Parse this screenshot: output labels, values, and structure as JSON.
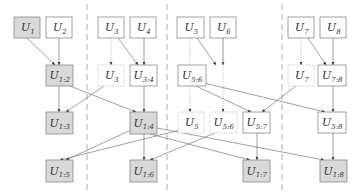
{
  "diagram": {
    "title": "",
    "colors": {
      "shaded_fill": "#d9d9d9",
      "plain_fill": "#ffffff",
      "stroke": "#8a8a8a",
      "edge": "#7a7a7a"
    },
    "separators": [
      87,
      167,
      282
    ],
    "nodes": [
      {
        "id": "r1_u1",
        "main": "U",
        "sub": "1",
        "x": 14,
        "y": 17,
        "w": 26,
        "h": 21,
        "style": "shaded"
      },
      {
        "id": "r1_u2",
        "main": "U",
        "sub": "2",
        "x": 46,
        "y": 17,
        "w": 26,
        "h": 21,
        "style": "plain"
      },
      {
        "id": "r1_u3",
        "main": "U",
        "sub": "3",
        "x": 98,
        "y": 17,
        "w": 26,
        "h": 21,
        "style": "plain"
      },
      {
        "id": "r1_u4",
        "main": "U",
        "sub": "4",
        "x": 130,
        "y": 17,
        "w": 26,
        "h": 21,
        "style": "plain"
      },
      {
        "id": "r1_u5",
        "main": "U",
        "sub": "5",
        "x": 177,
        "y": 17,
        "w": 27,
        "h": 21,
        "style": "plain"
      },
      {
        "id": "r1_u6",
        "main": "U",
        "sub": "6",
        "x": 210,
        "y": 17,
        "w": 26,
        "h": 21,
        "style": "plain"
      },
      {
        "id": "r1_u7",
        "main": "U",
        "sub": "7",
        "x": 288,
        "y": 17,
        "w": 26,
        "h": 21,
        "style": "plain"
      },
      {
        "id": "r1_u8",
        "main": "U",
        "sub": "8",
        "x": 320,
        "y": 17,
        "w": 26,
        "h": 21,
        "style": "plain"
      },
      {
        "id": "r2_u12",
        "main": "U",
        "sub": "1:2",
        "x": 46,
        "y": 65,
        "w": 27,
        "h": 21,
        "style": "shaded"
      },
      {
        "id": "r2_u3",
        "main": "U",
        "sub": "3",
        "x": 98,
        "y": 65,
        "w": 26,
        "h": 21,
        "style": "dotted"
      },
      {
        "id": "r2_u34",
        "main": "U",
        "sub": "3:4",
        "x": 130,
        "y": 65,
        "w": 27,
        "h": 21,
        "style": "plain"
      },
      {
        "id": "r2_u56",
        "main": "U",
        "sub": "5:6",
        "x": 178,
        "y": 65,
        "w": 28,
        "h": 21,
        "style": "plain"
      },
      {
        "id": "r2_u7",
        "main": "U",
        "sub": "7",
        "x": 288,
        "y": 65,
        "w": 26,
        "h": 21,
        "style": "dotted"
      },
      {
        "id": "r2_u78",
        "main": "U",
        "sub": "7:8",
        "x": 318,
        "y": 65,
        "w": 28,
        "h": 21,
        "style": "plain"
      },
      {
        "id": "r3_u13",
        "main": "U",
        "sub": "1:3",
        "x": 46,
        "y": 112,
        "w": 27,
        "h": 22,
        "style": "shaded"
      },
      {
        "id": "r3_u14",
        "main": "U",
        "sub": "1:4",
        "x": 130,
        "y": 112,
        "w": 27,
        "h": 22,
        "style": "shaded"
      },
      {
        "id": "r3_u5",
        "main": "U",
        "sub": "5",
        "x": 178,
        "y": 112,
        "w": 26,
        "h": 21,
        "style": "dotted"
      },
      {
        "id": "r3_u56",
        "main": "U",
        "sub": "5:6",
        "x": 210,
        "y": 112,
        "w": 27,
        "h": 21,
        "style": "dotted"
      },
      {
        "id": "r3_u57",
        "main": "U",
        "sub": "5:7",
        "x": 243,
        "y": 112,
        "w": 27,
        "h": 21,
        "style": "plain"
      },
      {
        "id": "r3_u58",
        "main": "U",
        "sub": "5:8",
        "x": 318,
        "y": 112,
        "w": 28,
        "h": 21,
        "style": "plain"
      },
      {
        "id": "r4_u15",
        "main": "U",
        "sub": "1:5",
        "x": 46,
        "y": 160,
        "w": 27,
        "h": 22,
        "style": "shaded"
      },
      {
        "id": "r4_u16",
        "main": "U",
        "sub": "1:6",
        "x": 130,
        "y": 160,
        "w": 27,
        "h": 22,
        "style": "shaded"
      },
      {
        "id": "r4_u17",
        "main": "U",
        "sub": "1:7",
        "x": 243,
        "y": 160,
        "w": 27,
        "h": 22,
        "style": "shaded"
      },
      {
        "id": "r4_u18",
        "main": "U",
        "sub": "1:8",
        "x": 320,
        "y": 160,
        "w": 27,
        "h": 22,
        "style": "shaded"
      }
    ],
    "edges": [
      {
        "from": "r1_u1",
        "to": "r2_u12",
        "x1": 27,
        "y1": 38,
        "x2": 55,
        "y2": 65
      },
      {
        "from": "r1_u2",
        "to": "r2_u12",
        "x1": 59,
        "y1": 38,
        "x2": 59,
        "y2": 65
      },
      {
        "from": "r1_u3",
        "to": "r2_u3",
        "x1": 111,
        "y1": 38,
        "x2": 111,
        "y2": 65,
        "style": "dotted"
      },
      {
        "from": "r1_u3",
        "to": "r2_u34",
        "x1": 118,
        "y1": 38,
        "x2": 138,
        "y2": 65
      },
      {
        "from": "r1_u4",
        "to": "r2_u34",
        "x1": 144,
        "y1": 38,
        "x2": 144,
        "y2": 65
      },
      {
        "from": "r1_u5",
        "to": "r2_u56",
        "x1": 197,
        "y1": 38,
        "x2": 216,
        "y2": 65
      },
      {
        "from": "r1_u6",
        "to": "r2_u56",
        "x1": 223,
        "y1": 38,
        "x2": 223,
        "y2": 65,
        "note": "drawn into U5:6 top"
      },
      {
        "from": "r1_u5",
        "to": "r3_u5",
        "x1": 190,
        "y1": 38,
        "x2": 190,
        "y2": 112,
        "style": "dotted"
      },
      {
        "from": "r1_u6",
        "to": "r3_u56",
        "x1": 223,
        "y1": 38,
        "x2": 223,
        "y2": 112,
        "style": "dotted"
      },
      {
        "from": "r1_u7",
        "to": "r2_u7",
        "x1": 301,
        "y1": 38,
        "x2": 301,
        "y2": 65,
        "style": "dotted"
      },
      {
        "from": "r1_u7",
        "to": "r2_u78",
        "x1": 308,
        "y1": 38,
        "x2": 326,
        "y2": 65
      },
      {
        "from": "r1_u8",
        "to": "r2_u78",
        "x1": 333,
        "y1": 38,
        "x2": 333,
        "y2": 65
      },
      {
        "from": "r2_u12",
        "to": "r3_u13",
        "x1": 59,
        "y1": 86,
        "x2": 59,
        "y2": 112
      },
      {
        "from": "r2_u3",
        "to": "r3_u13",
        "x1": 104,
        "y1": 86,
        "x2": 66,
        "y2": 112
      },
      {
        "from": "r2_u12",
        "to": "r3_u14",
        "x1": 70,
        "y1": 86,
        "x2": 136,
        "y2": 112
      },
      {
        "from": "r2_u34",
        "to": "r3_u14",
        "x1": 144,
        "y1": 86,
        "x2": 144,
        "y2": 112
      },
      {
        "from": "r2_u56",
        "to": "r3_u57",
        "x1": 196,
        "y1": 86,
        "x2": 251,
        "y2": 112
      },
      {
        "from": "r2_u7",
        "to": "r3_u57",
        "x1": 296,
        "y1": 86,
        "x2": 262,
        "y2": 112
      },
      {
        "from": "r2_u56",
        "to": "r3_u58",
        "x1": 204,
        "y1": 83,
        "x2": 325,
        "y2": 112
      },
      {
        "from": "r2_u78",
        "to": "r3_u58",
        "x1": 333,
        "y1": 86,
        "x2": 333,
        "y2": 112
      },
      {
        "from": "r3_u5",
        "to": "r4_u15",
        "x1": 180,
        "y1": 130,
        "x2": 60,
        "y2": 160
      },
      {
        "from": "r3_u14",
        "to": "r4_u15",
        "x1": 131,
        "y1": 130,
        "x2": 66,
        "y2": 160,
        "note": "crossing line"
      },
      {
        "from": "r3_u56",
        "to": "r4_u16",
        "x1": 215,
        "y1": 133,
        "x2": 150,
        "y2": 160
      },
      {
        "from": "r3_u14",
        "to": "r4_u16",
        "x1": 144,
        "y1": 134,
        "x2": 144,
        "y2": 160
      },
      {
        "from": "r3_u14",
        "to": "r4_u17",
        "x1": 150,
        "y1": 134,
        "x2": 250,
        "y2": 160
      },
      {
        "from": "r3_u57",
        "to": "r4_u17",
        "x1": 257,
        "y1": 133,
        "x2": 257,
        "y2": 160
      },
      {
        "from": "r3_u14",
        "to": "r4_u18",
        "x1": 157,
        "y1": 128,
        "x2": 324,
        "y2": 160
      },
      {
        "from": "r3_u58",
        "to": "r4_u18",
        "x1": 333,
        "y1": 133,
        "x2": 333,
        "y2": 160
      }
    ]
  }
}
